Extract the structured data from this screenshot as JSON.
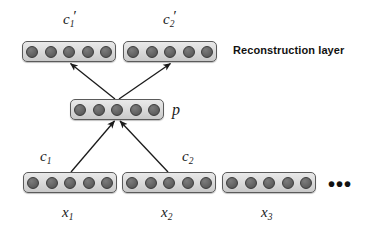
{
  "figure": {
    "caption_label": "Reconstruction layer",
    "ellipsis": "•••",
    "colors": {
      "background": "#ffffff",
      "box_fill": "#dcdcdc",
      "box_border": "#5a5a5a",
      "node_fill": "#5a5a5a",
      "node_border": "#3a3a3a",
      "arrow": "#1a1a1a",
      "text": "#1a1a1a"
    }
  },
  "layers": {
    "reconstruction": {
      "name": "reconstruction-layer",
      "vectors": [
        {
          "id": "c1-prime",
          "label_base": "c",
          "label_sub": "1",
          "label_prime": "′",
          "node_count": 5
        },
        {
          "id": "c2-prime",
          "label_base": "c",
          "label_sub": "2",
          "label_prime": "′",
          "node_count": 5
        }
      ]
    },
    "pooling": {
      "name": "pooling-layer",
      "vectors": [
        {
          "id": "p",
          "label_base": "p",
          "label_sub": "",
          "label_prime": "",
          "node_count": 5
        }
      ]
    },
    "input": {
      "name": "input-layer",
      "vectors": [
        {
          "id": "x1",
          "label_base": "x",
          "label_sub": "1",
          "label_prime": "",
          "node_count": 5,
          "context_base": "c",
          "context_sub": "1"
        },
        {
          "id": "x2",
          "label_base": "x",
          "label_sub": "2",
          "label_prime": "",
          "node_count": 5,
          "context_base": "c",
          "context_sub": "2"
        },
        {
          "id": "x3",
          "label_base": "x",
          "label_sub": "3",
          "label_prime": "",
          "node_count": 5,
          "context_base": "",
          "context_sub": ""
        }
      ]
    }
  },
  "arrows": [
    {
      "id": "p-to-c1prime",
      "from": "p",
      "to": "c1-prime",
      "direction": "up"
    },
    {
      "id": "p-to-c2prime",
      "from": "p",
      "to": "c2-prime",
      "direction": "up"
    },
    {
      "id": "c1-to-p",
      "from": "x1",
      "to": "p",
      "direction": "up"
    },
    {
      "id": "c2-to-p",
      "from": "x2",
      "to": "p",
      "direction": "up"
    }
  ]
}
